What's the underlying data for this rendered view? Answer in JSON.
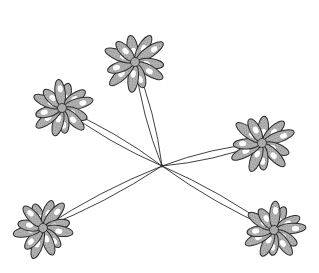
{
  "figure": {
    "colors": {
      "background": "#ffffff",
      "ink": "#2a2a2a",
      "stipple": "#8a8a8a",
      "highlight": "#ffffff"
    },
    "center": {
      "x": 162,
      "y": 166
    },
    "clusters": [
      {
        "id": "top",
        "x": 135,
        "y": 62,
        "r": 32,
        "rot": -10,
        "petals": 11
      },
      {
        "id": "upper-left",
        "x": 62,
        "y": 108,
        "r": 30,
        "rot": 15,
        "petals": 12
      },
      {
        "id": "right",
        "x": 262,
        "y": 143,
        "r": 32,
        "rot": 5,
        "petals": 11
      },
      {
        "id": "lower-left",
        "x": 43,
        "y": 228,
        "r": 30,
        "rot": -20,
        "petals": 12
      },
      {
        "id": "lower-right",
        "x": 274,
        "y": 230,
        "r": 30,
        "rot": 25,
        "petals": 12
      }
    ]
  }
}
